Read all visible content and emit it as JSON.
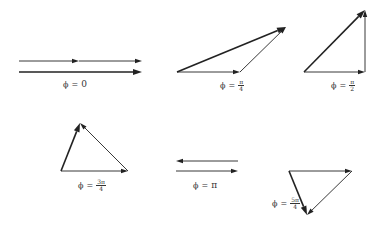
{
  "diagram": {
    "stroke_color": "#222222",
    "panels": [
      {
        "id": "phi-0",
        "label": {
          "symbol": "ϕ",
          "equals": "=",
          "value": "0"
        },
        "vectors": [
          {
            "role": "component-1",
            "from": [
              19,
              61
            ],
            "to": [
              79,
              61
            ],
            "weight": "thin"
          },
          {
            "role": "component-2",
            "from": [
              79,
              61
            ],
            "to": [
              142,
              61
            ],
            "weight": "thin"
          },
          {
            "role": "resultant",
            "from": [
              19,
              72
            ],
            "to": [
              142,
              72
            ],
            "weight": "bold"
          }
        ]
      },
      {
        "id": "phi-pi-over-4",
        "label": {
          "symbol": "ϕ",
          "equals": "=",
          "num": "π",
          "den": "4"
        },
        "vectors": [
          {
            "role": "component-1",
            "from": [
              177,
              72
            ],
            "to": [
              240,
              72
            ],
            "weight": "thin"
          },
          {
            "role": "component-2",
            "from": [
              240,
              72
            ],
            "to": [
              286,
              27
            ],
            "weight": "thin"
          },
          {
            "role": "resultant",
            "from": [
              177,
              72
            ],
            "to": [
              286,
              27
            ],
            "weight": "bold"
          }
        ]
      },
      {
        "id": "phi-pi-over-2",
        "label": {
          "symbol": "ϕ",
          "equals": "=",
          "num": "π",
          "den": "2"
        },
        "vectors": [
          {
            "role": "component-1",
            "from": [
              304,
              72
            ],
            "to": [
              365,
              72
            ],
            "weight": "thin"
          },
          {
            "role": "component-2",
            "from": [
              365,
              72
            ],
            "to": [
              365,
              10
            ],
            "weight": "thin"
          },
          {
            "role": "resultant",
            "from": [
              304,
              72
            ],
            "to": [
              365,
              10
            ],
            "weight": "bold"
          }
        ]
      },
      {
        "id": "phi-3pi-over-4",
        "label": {
          "symbol": "ϕ",
          "equals": "=",
          "num": "3π",
          "den": "4"
        },
        "vectors": [
          {
            "role": "component-1",
            "from": [
              61,
              171
            ],
            "to": [
              128,
              171
            ],
            "weight": "thin"
          },
          {
            "role": "component-2",
            "from": [
              128,
              171
            ],
            "to": [
              80,
              123
            ],
            "weight": "thin"
          },
          {
            "role": "resultant",
            "from": [
              61,
              171
            ],
            "to": [
              80,
              123
            ],
            "weight": "bold"
          }
        ]
      },
      {
        "id": "phi-pi",
        "label": {
          "symbol": "ϕ",
          "equals": "=",
          "value": "π"
        },
        "vectors": [
          {
            "role": "component-1",
            "from": [
              176,
              171
            ],
            "to": [
              238,
              171
            ],
            "weight": "thin"
          },
          {
            "role": "component-2",
            "from": [
              238,
              161
            ],
            "to": [
              176,
              161
            ],
            "weight": "thin"
          }
        ]
      },
      {
        "id": "phi-5pi-over-4",
        "label": {
          "symbol": "ϕ",
          "equals": "=",
          "num": "5π",
          "den": "4"
        },
        "vectors": [
          {
            "role": "component-1",
            "from": [
              289,
              171
            ],
            "to": [
              352,
              171
            ],
            "weight": "thin"
          },
          {
            "role": "component-2",
            "from": [
              352,
              171
            ],
            "to": [
              307,
              215
            ],
            "weight": "thin"
          },
          {
            "role": "resultant",
            "from": [
              289,
              171
            ],
            "to": [
              307,
              215
            ],
            "weight": "bold"
          }
        ]
      }
    ]
  }
}
